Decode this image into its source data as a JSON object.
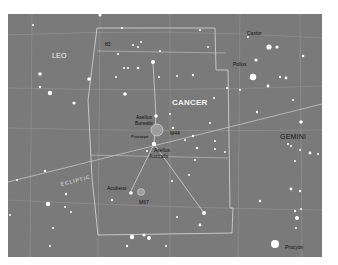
{
  "map": {
    "title": "Cancer star chart",
    "background_color": "#7a7a7a",
    "constellations": [
      {
        "name": "LEO",
        "x": 52,
        "y": 52
      },
      {
        "name": "CANCER",
        "x": 173,
        "y": 98
      },
      {
        "name": "GEMINI",
        "x": 280,
        "y": 133
      }
    ],
    "star_labels": [
      {
        "name": "Castor",
        "x": 247,
        "y": 31
      },
      {
        "name": "Pollux",
        "x": 233,
        "y": 62
      },
      {
        "name": "Asellus",
        "x": 136,
        "y": 115
      },
      {
        "name": "Borealis",
        "x": 135,
        "y": 121
      },
      {
        "name": "Asellus",
        "x": 154,
        "y": 148
      },
      {
        "name": "Australis",
        "x": 149,
        "y": 154
      },
      {
        "name": "Acubens",
        "x": 107,
        "y": 186
      },
      {
        "name": "Procyon",
        "x": 285,
        "y": 245
      }
    ],
    "objects": [
      {
        "name": "Praesepe",
        "x": 131,
        "y": 133
      },
      {
        "name": "M44",
        "x": 170,
        "y": 131
      },
      {
        "name": "M67",
        "x": 139,
        "y": 200
      },
      {
        "name": "83",
        "x": 105,
        "y": 42
      }
    ],
    "ecliptic_label": "ECLIPTIC"
  }
}
